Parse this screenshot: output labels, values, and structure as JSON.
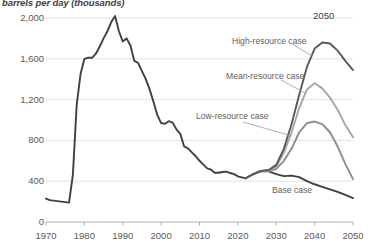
{
  "chart_data": {
    "type": "line",
    "title": "barrels per day (thousands)",
    "xlabel": "",
    "ylabel": "barrels per day (thousands)",
    "xlim": [
      1970,
      2050
    ],
    "ylim": [
      0,
      2000
    ],
    "grid": true,
    "legend_position": "inline-annotations",
    "yticks": [
      "0",
      "400",
      "800",
      "1,200",
      "1,600",
      "2,000"
    ],
    "ytick_values": [
      0,
      400,
      800,
      1200,
      1600,
      2000
    ],
    "xticks": [
      "1970",
      "1980",
      "1990",
      "2000",
      "2010",
      "2020",
      "2030",
      "2040",
      "2050"
    ],
    "xtick_values": [
      1970,
      1980,
      1990,
      2000,
      2010,
      2020,
      2030,
      2040,
      2050
    ],
    "end_year_label": "2050",
    "series": [
      {
        "name": "Historical",
        "color": "#404040",
        "x": [
          1970,
          1971,
          1972,
          1973,
          1974,
          1975,
          1976,
          1977,
          1978,
          1979,
          1980,
          1981,
          1982,
          1983,
          1984,
          1985,
          1986,
          1987,
          1988,
          1989,
          1990,
          1991,
          1992,
          1993,
          1994,
          1995,
          1996,
          1997,
          1998,
          1999,
          2000,
          2001,
          2002,
          2003,
          2004,
          2005,
          2006,
          2007,
          2008,
          2009,
          2010,
          2011,
          2012,
          2013,
          2014,
          2015,
          2016,
          2017,
          2018,
          2019,
          2020,
          2021,
          2022
        ],
        "values": [
          230,
          215,
          210,
          205,
          200,
          195,
          190,
          460,
          1150,
          1450,
          1600,
          1610,
          1610,
          1650,
          1720,
          1800,
          1870,
          1960,
          2020,
          1870,
          1770,
          1800,
          1730,
          1580,
          1560,
          1480,
          1400,
          1300,
          1180,
          1050,
          970,
          963,
          988,
          974,
          908,
          864,
          741,
          722,
          683,
          645,
          600,
          563,
          526,
          513,
          483,
          483,
          490,
          494,
          480,
          470,
          448,
          437,
          429
        ]
      },
      {
        "name": "Base case",
        "color": "#404040",
        "x": [
          2022,
          2024,
          2026,
          2028,
          2030,
          2032,
          2034,
          2036,
          2038,
          2040,
          2042,
          2044,
          2046,
          2048,
          2050
        ],
        "values": [
          429,
          470,
          500,
          497,
          470,
          450,
          455,
          440,
          400,
          370,
          345,
          320,
          295,
          265,
          235
        ]
      },
      {
        "name": "Low-resource case",
        "color": "#8c8c8c",
        "x": [
          2022,
          2024,
          2026,
          2028,
          2030,
          2032,
          2034,
          2036,
          2038,
          2040,
          2042,
          2044,
          2046,
          2048,
          2050
        ],
        "values": [
          429,
          470,
          500,
          500,
          520,
          600,
          720,
          880,
          970,
          985,
          960,
          880,
          740,
          570,
          420
        ]
      },
      {
        "name": "Mean-resource case",
        "color": "#a6a6a6",
        "x": [
          2022,
          2024,
          2026,
          2028,
          2030,
          2032,
          2034,
          2036,
          2038,
          2040,
          2042,
          2044,
          2046,
          2048,
          2050
        ],
        "values": [
          429,
          470,
          500,
          505,
          540,
          680,
          880,
          1120,
          1300,
          1360,
          1310,
          1220,
          1100,
          950,
          830
        ]
      },
      {
        "name": "High-resource case",
        "color": "#595959",
        "x": [
          2022,
          2024,
          2026,
          2028,
          2030,
          2032,
          2034,
          2036,
          2038,
          2040,
          2042,
          2044,
          2046,
          2048,
          2050
        ],
        "values": [
          429,
          470,
          500,
          510,
          560,
          720,
          960,
          1250,
          1520,
          1700,
          1760,
          1750,
          1680,
          1580,
          1490
        ]
      }
    ],
    "annotations": [
      {
        "text": "High-resource case",
        "x": 232,
        "y": 37
      },
      {
        "text": "Mean-resource case",
        "x": 226,
        "y": 72
      },
      {
        "text": "Low-resource case",
        "x": 196,
        "y": 112
      },
      {
        "text": "Base case",
        "x": 272,
        "y": 186
      }
    ]
  },
  "colors": {
    "historical": "#404040",
    "base": "#404040",
    "low": "#8c8c8c",
    "mean": "#a6a6a6",
    "high": "#595959",
    "grid": "#e2e2e2",
    "axis": "#b0b0b0",
    "text": "#595959"
  }
}
